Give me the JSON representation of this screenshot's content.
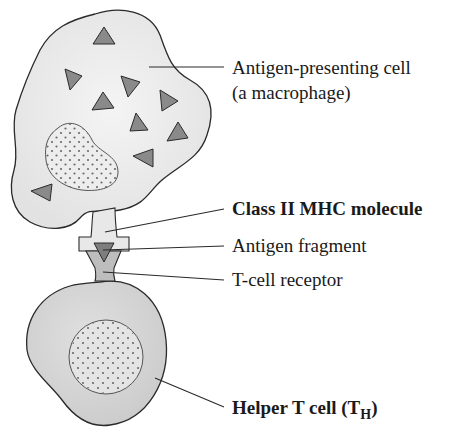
{
  "diagram": {
    "labels": {
      "apc_line1": "Antigen-presenting cell",
      "apc_line2": "(a macrophage)",
      "mhc": "Class II MHC molecule",
      "antigen": "Antigen fragment",
      "tcr": "T-cell receptor",
      "helper_main": "Helper T cell (T",
      "helper_sub": "H",
      "helper_close": ")"
    },
    "colors": {
      "apc_fill": "#ececec",
      "helper_fill": "#d6d6d6",
      "antigen_fill": "#8a8a8a",
      "mhc_fill": "#e8e8e8",
      "tcr_fill": "#bdbdbd",
      "outline": "#2a2a2a"
    }
  }
}
